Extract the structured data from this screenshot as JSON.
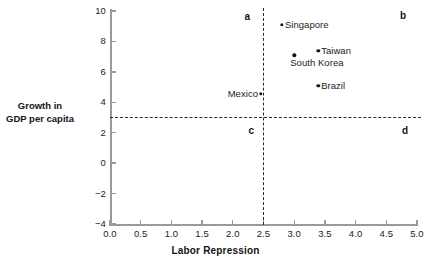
{
  "chart_data": {
    "type": "scatter",
    "title": "",
    "xlabel": "Labor Repression",
    "ylabel_lines": [
      "Growth in",
      "GDP per capita"
    ],
    "xlim": [
      0.0,
      5.0
    ],
    "ylim": [
      -4,
      10
    ],
    "grid": false,
    "legend": null,
    "xticks": [
      "0.0",
      "0.5",
      "1.0",
      "1.5",
      "2.0",
      "2.5",
      "3.0",
      "3.5",
      "4.0",
      "4.5",
      "5.0"
    ],
    "xtick_values": [
      0.0,
      0.5,
      1.0,
      1.5,
      2.0,
      2.5,
      3.0,
      3.5,
      4.0,
      4.5,
      5.0
    ],
    "yticks": [
      "10",
      "8",
      "6",
      "4",
      "2",
      "0",
      "−2",
      "−4"
    ],
    "ytick_values": [
      10,
      8,
      6,
      4,
      2,
      0,
      -2,
      -4
    ],
    "points": [
      {
        "label": "Singapore",
        "x": 2.8,
        "y": 9.1,
        "label_side": "right"
      },
      {
        "label": "Taiwan",
        "x": 3.39,
        "y": 7.4,
        "label_side": "right"
      },
      {
        "label": "South Korea",
        "x": 3.0,
        "y": 7.1,
        "label_side": "below"
      },
      {
        "label": "Brazil",
        "x": 3.39,
        "y": 5.1,
        "label_side": "right"
      },
      {
        "label": "Mexico",
        "x": 2.46,
        "y": 4.55,
        "label_side": "left"
      }
    ],
    "reference_lines": [
      {
        "orientation": "vertical",
        "value": 2.5
      },
      {
        "orientation": "horizontal",
        "value": 3.0
      }
    ],
    "annotations": [
      {
        "text": "a",
        "quadrant": "top-left"
      },
      {
        "text": "b",
        "quadrant": "top-right"
      },
      {
        "text": "c",
        "quadrant": "bottom-left"
      },
      {
        "text": "d",
        "quadrant": "bottom-right"
      }
    ],
    "colors": {
      "point": "#151515",
      "axis": "#9a9a9a",
      "dashed_line": "#2a2a2a",
      "text": "#1b1b1b",
      "background": "#ffffff"
    }
  }
}
